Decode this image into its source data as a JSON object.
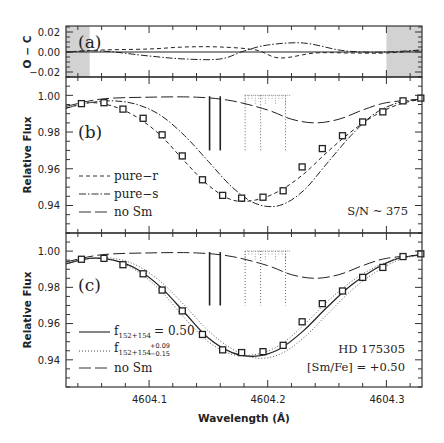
{
  "figure": {
    "xlabel": "Wavelength (Å)",
    "x_ticks": [
      "4604.1",
      "4604.2",
      "4604.3"
    ]
  },
  "panels": {
    "a": {
      "label": "(a)",
      "ylabel": "O − C",
      "y_ticks": [
        "0.02",
        "0.00",
        "−0.02"
      ]
    },
    "b": {
      "label": "(b)",
      "ylabel": "Relative Flux",
      "y_ticks": [
        "1.00",
        "0.98",
        "0.96",
        "0.94"
      ],
      "legend": [
        "pure−r",
        "pure−s",
        "no Sm"
      ],
      "annotation": "S/N ~ 375"
    },
    "c": {
      "label": "(c)",
      "ylabel": "Relative Flux",
      "y_ticks": [
        "1.00",
        "0.98",
        "0.96",
        "0.94"
      ],
      "legend_f1_main": "f",
      "legend_f1_sub": "152+154",
      "legend_f1_val": "= 0.50",
      "legend_f2_main": "f",
      "legend_f2_sub": "152+154",
      "legend_f2_sup": "+0.09",
      "legend_f2_inf": "−0.15",
      "legend_nosm": "no Sm",
      "annotation_star": "HD 175305",
      "annotation_abund": "[Sm/Fe] = +0.50"
    }
  },
  "chart_data": [
    {
      "panel": "a",
      "type": "line",
      "title": "",
      "xlabel": "Wavelength (Å)",
      "ylabel": "O − C",
      "xlim": [
        4604.03,
        4604.33
      ],
      "ylim": [
        -0.025,
        0.026
      ],
      "y_ticks": [
        0.02,
        0.0,
        -0.02
      ],
      "shaded_regions": [
        [
          4604.03,
          4604.05
        ],
        [
          4604.3,
          4604.33
        ]
      ],
      "series": [
        {
          "name": "zero",
          "style": "solid",
          "x": [
            4604.03,
            4604.33
          ],
          "y": [
            0.0,
            0.0
          ]
        },
        {
          "name": "pure-r residual",
          "style": "dashed",
          "x": [
            4604.03,
            4604.06,
            4604.1,
            4604.13,
            4604.16,
            4604.19,
            4604.21,
            4604.24,
            4604.27,
            4604.3,
            4604.33
          ],
          "y": [
            0.0,
            0.002,
            0.003,
            0.005,
            0.005,
            0.002,
            -0.006,
            -0.001,
            -0.001,
            -0.001,
            0.002
          ]
        },
        {
          "name": "pure-s residual",
          "style": "dash-dot",
          "x": [
            4604.03,
            4604.06,
            4604.1,
            4604.13,
            4604.16,
            4604.18,
            4604.2,
            4604.23,
            4604.26,
            4604.28,
            4604.3,
            4604.33
          ],
          "y": [
            0.0,
            0.001,
            -0.004,
            -0.007,
            -0.007,
            0.001,
            0.007,
            0.009,
            0.002,
            0.0,
            0.0,
            0.002
          ]
        }
      ]
    },
    {
      "panel": "b",
      "type": "line",
      "title": "",
      "xlabel": "Wavelength (Å)",
      "ylabel": "Relative Flux",
      "xlim": [
        4604.03,
        4604.33
      ],
      "ylim": [
        0.925,
        1.01
      ],
      "y_ticks": [
        1.0,
        0.98,
        0.96,
        0.94
      ],
      "observed": {
        "name": "observed",
        "marker": "square",
        "x": [
          4604.043,
          4604.062,
          4604.078,
          4604.095,
          4604.111,
          4604.128,
          4604.145,
          4604.162,
          4604.178,
          4604.196,
          4604.213,
          4604.229,
          4604.246,
          4604.263,
          4604.28,
          4604.297,
          4604.314,
          4604.329
        ],
        "y": [
          0.9955,
          0.996,
          0.9925,
          0.9875,
          0.9785,
          0.967,
          0.954,
          0.9455,
          0.944,
          0.9445,
          0.948,
          0.961,
          0.971,
          0.978,
          0.9855,
          0.991,
          0.997,
          0.9985
        ]
      },
      "series": [
        {
          "name": "pure-r",
          "style": "dashed",
          "x": [
            4604.03,
            4604.05,
            4604.07,
            4604.09,
            4604.11,
            4604.13,
            4604.15,
            4604.17,
            4604.19,
            4604.21,
            4604.23,
            4604.25,
            4604.27,
            4604.29,
            4604.31,
            4604.33
          ],
          "y": [
            0.993,
            0.996,
            0.994,
            0.988,
            0.978,
            0.964,
            0.951,
            0.943,
            0.943,
            0.948,
            0.957,
            0.969,
            0.98,
            0.989,
            0.995,
            0.998
          ]
        },
        {
          "name": "pure-s",
          "style": "dash-dot",
          "x": [
            4604.03,
            4604.05,
            4604.07,
            4604.09,
            4604.11,
            4604.13,
            4604.15,
            4604.17,
            4604.19,
            4604.21,
            4604.23,
            4604.25,
            4604.27,
            4604.29,
            4604.31,
            4604.33
          ],
          "y": [
            0.993,
            0.996,
            0.997,
            0.995,
            0.989,
            0.978,
            0.964,
            0.95,
            0.941,
            0.94,
            0.948,
            0.963,
            0.978,
            0.99,
            0.996,
            0.998
          ]
        },
        {
          "name": "no Sm",
          "style": "long-dash",
          "x": [
            4604.03,
            4604.06,
            4604.1,
            4604.14,
            4604.17,
            4604.2,
            4604.22,
            4604.24,
            4604.26,
            4604.28,
            4604.3,
            4604.33
          ],
          "y": [
            0.994,
            0.998,
            0.999,
            0.999,
            0.997,
            0.992,
            0.987,
            0.985,
            0.987,
            0.992,
            0.996,
            0.998
          ]
        }
      ],
      "line_markers": {
        "solid": [
          4604.151,
          4604.16
        ],
        "dotted": [
          4604.181,
          4604.194,
          4604.215
        ]
      }
    },
    {
      "panel": "c",
      "type": "line",
      "title": "",
      "xlabel": "Wavelength (Å)",
      "ylabel": "Relative Flux",
      "xlim": [
        4604.03,
        4604.33
      ],
      "ylim": [
        0.925,
        1.01
      ],
      "y_ticks": [
        1.0,
        0.98,
        0.96,
        0.94
      ],
      "observed": {
        "name": "observed",
        "marker": "square",
        "x": [
          4604.043,
          4604.062,
          4604.078,
          4604.095,
          4604.111,
          4604.128,
          4604.145,
          4604.162,
          4604.178,
          4604.196,
          4604.213,
          4604.229,
          4604.246,
          4604.263,
          4604.28,
          4604.297,
          4604.314,
          4604.329
        ],
        "y": [
          0.9955,
          0.996,
          0.9925,
          0.9875,
          0.9785,
          0.967,
          0.954,
          0.9455,
          0.944,
          0.9445,
          0.948,
          0.961,
          0.971,
          0.978,
          0.9855,
          0.991,
          0.997,
          0.9985
        ]
      },
      "series": [
        {
          "name": "f152+154 = 0.50",
          "style": "solid",
          "x": [
            4604.03,
            4604.05,
            4604.07,
            4604.09,
            4604.11,
            4604.13,
            4604.15,
            4604.17,
            4604.19,
            4604.21,
            4604.23,
            4604.25,
            4604.27,
            4604.29,
            4604.31,
            4604.33
          ],
          "y": [
            0.993,
            0.996,
            0.995,
            0.99,
            0.98,
            0.966,
            0.952,
            0.944,
            0.942,
            0.946,
            0.956,
            0.969,
            0.981,
            0.99,
            0.996,
            0.998
          ]
        },
        {
          "name": "f152+154 +0.09",
          "style": "dotted",
          "x": [
            4604.03,
            4604.05,
            4604.07,
            4604.09,
            4604.11,
            4604.13,
            4604.15,
            4604.17,
            4604.19,
            4604.21,
            4604.23,
            4604.25,
            4604.27,
            4604.29,
            4604.31,
            4604.33
          ],
          "y": [
            0.993,
            0.996,
            0.995,
            0.989,
            0.978,
            0.963,
            0.95,
            0.943,
            0.943,
            0.948,
            0.959,
            0.972,
            0.983,
            0.991,
            0.996,
            0.998
          ]
        },
        {
          "name": "f152+154 -0.15",
          "style": "dotted",
          "x": [
            4604.03,
            4604.05,
            4604.07,
            4604.09,
            4604.11,
            4604.13,
            4604.15,
            4604.17,
            4604.19,
            4604.21,
            4604.23,
            4604.25,
            4604.27,
            4604.29,
            4604.31,
            4604.33
          ],
          "y": [
            0.993,
            0.996,
            0.996,
            0.992,
            0.983,
            0.97,
            0.956,
            0.946,
            0.941,
            0.943,
            0.952,
            0.965,
            0.978,
            0.988,
            0.995,
            0.998
          ]
        },
        {
          "name": "no Sm",
          "style": "long-dash",
          "x": [
            4604.03,
            4604.06,
            4604.1,
            4604.14,
            4604.17,
            4604.2,
            4604.22,
            4604.24,
            4604.26,
            4604.28,
            4604.3,
            4604.33
          ],
          "y": [
            0.994,
            0.998,
            0.999,
            0.999,
            0.997,
            0.992,
            0.987,
            0.985,
            0.987,
            0.992,
            0.996,
            0.998
          ]
        }
      ],
      "line_markers": {
        "solid": [
          4604.151,
          4604.16
        ],
        "dotted": [
          4604.181,
          4604.194,
          4604.215
        ]
      }
    }
  ]
}
